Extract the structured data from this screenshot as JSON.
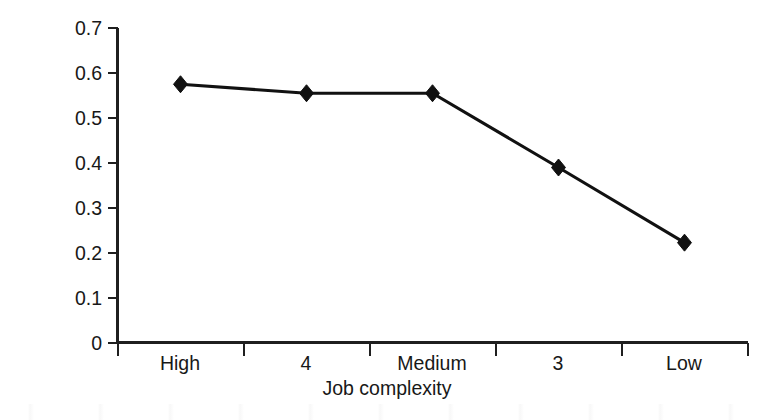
{
  "chart_data": {
    "type": "line",
    "title": "",
    "xlabel": "Job complexity",
    "ylabel": "Validity",
    "categories": [
      "High",
      "4",
      "Medium",
      "3",
      "Low"
    ],
    "values": [
      0.575,
      0.555,
      0.555,
      0.39,
      0.223
    ],
    "series": [
      {
        "name": "Validity",
        "values": [
          0.575,
          0.555,
          0.555,
          0.39,
          0.223
        ],
        "marker": "diamond",
        "color": "#111111"
      }
    ],
    "ylim": [
      0,
      0.7
    ],
    "ytick_labels": [
      "0.7",
      "0.6",
      "0.5",
      "0.4",
      "0.3",
      "0.2",
      "0.1",
      "0"
    ],
    "ytick_values": [
      0.7,
      0.6,
      0.5,
      0.4,
      0.3,
      0.2,
      0.1,
      0
    ],
    "xtick_labels": [
      "High",
      "4",
      "Medium",
      "3",
      "Low"
    ],
    "grid": false,
    "legend": false,
    "legend_position": "none",
    "line_color": "#111111",
    "axis_color": "#1f1f1f",
    "background_color": "#ffffff"
  },
  "axes": {
    "y_title": "Validity",
    "x_title": "Job complexity"
  }
}
